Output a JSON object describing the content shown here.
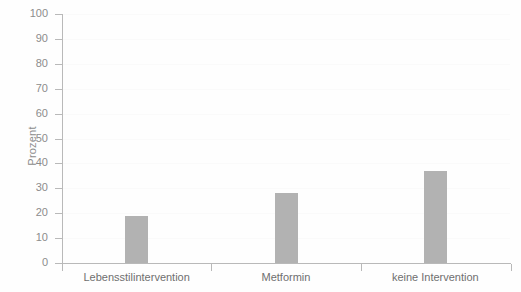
{
  "chart_data": {
    "type": "bar",
    "title": "",
    "subtitle": "",
    "xlabel": "",
    "ylabel": "Prozent",
    "categories": [
      "Lebensstilintervention",
      "Metformin",
      "keine Intervention"
    ],
    "values": [
      19,
      28,
      37
    ],
    "series": [
      {
        "name": "Prozent",
        "values": [
          19,
          28,
          37
        ],
        "color": "#b2b2b2"
      }
    ],
    "ylim": [
      0,
      100
    ],
    "y_ticks": [
      0,
      10,
      20,
      30,
      40,
      50,
      60,
      70,
      80,
      90,
      100
    ],
    "y_tick_labels": [
      "0",
      "10",
      "20",
      "30",
      "40",
      "50",
      "60",
      "70",
      "80",
      "90",
      "100"
    ],
    "grid": true,
    "grid_axis": "y",
    "legend": false,
    "legend_position": "none",
    "annotations": [],
    "colors": {
      "bar": "#b2b2b2",
      "axis": "#b9b9b9",
      "grid": "#fafafa",
      "tick_label": "#8c8c8c",
      "category_label": "#6f6f6f",
      "background": "#fefefe"
    }
  }
}
